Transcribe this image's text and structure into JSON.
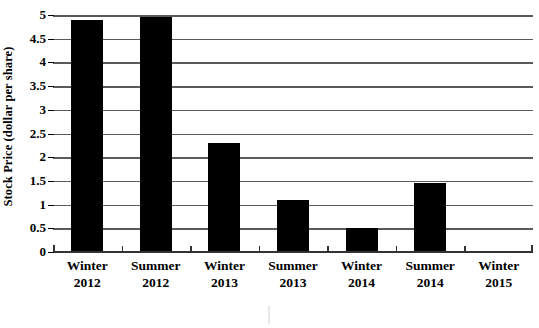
{
  "chart_data": {
    "type": "bar",
    "title": "",
    "xlabel": "",
    "ylabel": "Stock Price (dollar per share)",
    "categories": [
      "Winter 2012",
      "Summer 2012",
      "Winter 2013",
      "Summer 2013",
      "Winter 2014",
      "Summer 2014",
      "Winter 2015"
    ],
    "category_lines": [
      [
        "Winter",
        "2012"
      ],
      [
        "Summer",
        "2012"
      ],
      [
        "Winter",
        "2013"
      ],
      [
        "Summer",
        "2013"
      ],
      [
        "Winter",
        "2014"
      ],
      [
        "Summer",
        "2014"
      ],
      [
        "Winter",
        "2015"
      ]
    ],
    "values": [
      4.9,
      4.95,
      2.3,
      1.1,
      0.5,
      1.45,
      0
    ],
    "ylim": [
      0,
      5
    ],
    "ytick_labels": [
      "0",
      "0.5",
      "1",
      "1.5",
      "2",
      "2.5",
      "3",
      "3.5",
      "4",
      "4.5",
      "5"
    ],
    "ytick_values": [
      0,
      0.5,
      1,
      1.5,
      2,
      2.5,
      3,
      3.5,
      4,
      4.5,
      5
    ],
    "grid": true,
    "legend": false,
    "bar_color": "#000000",
    "gridline_color": "#5a5a5a",
    "axis_color": "#333333",
    "background_color": "#ffffff"
  }
}
